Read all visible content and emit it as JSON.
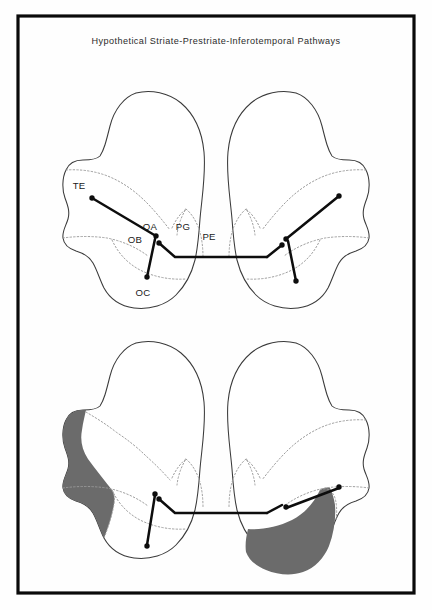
{
  "figure": {
    "title": "Hypothetical Striate-Prestriate-Inferotemporal Pathways",
    "background_color": "#fefefe",
    "frame_color": "#0a0a0a",
    "outline_color": "#3a3a3a",
    "dashed_color": "#9a9a9a",
    "pathway_color": "#0d0d0d",
    "shade_color": "#6b6b6b"
  },
  "panels": [
    {
      "id": "top-panel",
      "name": "intact-pathways-panel",
      "shaded": false,
      "labels": [
        {
          "text": "TE",
          "x": 79,
          "y": 189
        },
        {
          "text": "OA",
          "x": 150,
          "y": 230
        },
        {
          "text": "OB",
          "x": 135,
          "y": 243
        },
        {
          "text": "PG",
          "x": 183,
          "y": 230
        },
        {
          "text": "PE",
          "x": 209,
          "y": 240
        },
        {
          "text": "OC",
          "x": 143,
          "y": 296
        }
      ],
      "pathways": [
        {
          "name": "left-te-to-oa",
          "points": "92,198 156,236"
        },
        {
          "name": "left-oa-to-oc",
          "points": "155,239 147,277"
        },
        {
          "name": "left-oa-to-midline",
          "points": "159,243 175,257 267,257"
        },
        {
          "name": "right-te-to-oa",
          "points": "339,196 286,239"
        },
        {
          "name": "right-oa-to-oc",
          "points": "288,241 296,281"
        },
        {
          "name": "right-oa-to-midline",
          "points": "282,245 267,257"
        }
      ],
      "dots": [
        {
          "x": 92,
          "y": 198
        },
        {
          "x": 156,
          "y": 236
        },
        {
          "x": 147,
          "y": 277
        },
        {
          "x": 159,
          "y": 243
        },
        {
          "x": 339,
          "y": 196
        },
        {
          "x": 286,
          "y": 239
        },
        {
          "x": 296,
          "y": 281
        },
        {
          "x": 282,
          "y": 245
        }
      ]
    },
    {
      "id": "bottom-panel",
      "name": "lesioned-pathways-panel",
      "shaded": true,
      "labels": [],
      "shaded_regions": [
        {
          "name": "left-te-lesion",
          "side": "left"
        },
        {
          "name": "right-oc-lesion",
          "side": "right"
        }
      ],
      "pathways": [
        {
          "name": "left-oa-to-oc",
          "points": "155,495 147,545"
        },
        {
          "name": "left-oa-to-midline",
          "points": "159,499 175,513 267,513"
        },
        {
          "name": "right-te-to-oa",
          "points": "339,488 286,508"
        },
        {
          "name": "right-oa-to-midline",
          "points": "282,505 267,513"
        }
      ],
      "dots": [
        {
          "x": 155,
          "y": 494
        },
        {
          "x": 147,
          "y": 546
        },
        {
          "x": 159,
          "y": 499
        },
        {
          "x": 339,
          "y": 487
        },
        {
          "x": 286,
          "y": 507
        }
      ]
    }
  ]
}
